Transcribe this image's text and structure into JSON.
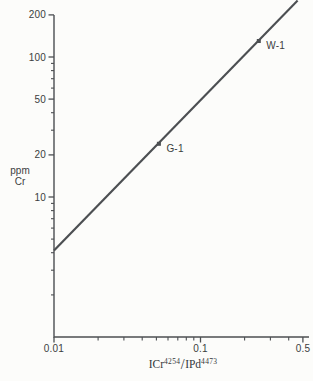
{
  "figure": {
    "background": "#fcfcfa",
    "axis_color": "#4c4f52",
    "text_color": "#3b3e40"
  },
  "chart_data": {
    "type": "line",
    "x_scale": "log",
    "y_scale": "log",
    "grid": false,
    "legend": null,
    "title": "",
    "xlim": [
      0.01,
      0.55
    ],
    "ylim": [
      1,
      200
    ],
    "xlabel": {
      "base1": "ICr",
      "sup1": "4254",
      "slash": "/",
      "base2": "IPd",
      "sup2": "4473"
    },
    "ylabel_lines": [
      "ppm",
      "Cr"
    ],
    "x_major_ticks": [
      {
        "v": 0.01,
        "label": "0.01"
      },
      {
        "v": 0.1,
        "label": "0.1"
      },
      {
        "v": 0.5,
        "label": "0.5"
      }
    ],
    "x_minor_ticks": [
      0.02,
      0.03,
      0.04,
      0.05,
      0.06,
      0.07,
      0.08,
      0.09,
      0.2,
      0.3,
      0.4
    ],
    "y_major_ticks": [
      {
        "v": 10,
        "label": "10"
      },
      {
        "v": 20,
        "label": "20"
      },
      {
        "v": 50,
        "label": "50"
      },
      {
        "v": 100,
        "label": "100"
      },
      {
        "v": 200,
        "label": "200"
      }
    ],
    "y_minor_ticks": [
      2,
      3,
      4,
      5,
      6,
      7,
      8,
      9,
      30,
      40,
      60,
      70,
      80,
      90
    ],
    "calibration_line": {
      "points": [
        [
          0.01,
          4.15
        ],
        [
          0.46,
          253
        ]
      ],
      "color": "#4c4f52",
      "width": 2.2
    },
    "points": [
      {
        "label": "G-1",
        "x": 0.052,
        "y": 24
      },
      {
        "label": "W-1",
        "x": 0.25,
        "y": 130
      }
    ]
  }
}
